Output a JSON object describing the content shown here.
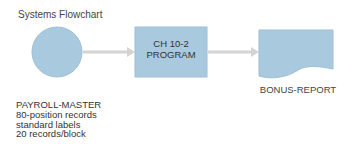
{
  "title": "Systems Flowchart",
  "colors": {
    "shape_fill": "#a9c9df",
    "shape_stroke": "#9cbfd7",
    "arrow": "#d4d4d4"
  },
  "input": {
    "shape": "circle",
    "lines": [
      "PAYROLL-MASTER",
      "80-position records",
      "standard labels",
      "20 records/block"
    ]
  },
  "process": {
    "shape": "rectangle",
    "lines": [
      "CH 10-2",
      "PROGRAM"
    ]
  },
  "output": {
    "shape": "document",
    "label": "BONUS-REPORT"
  }
}
